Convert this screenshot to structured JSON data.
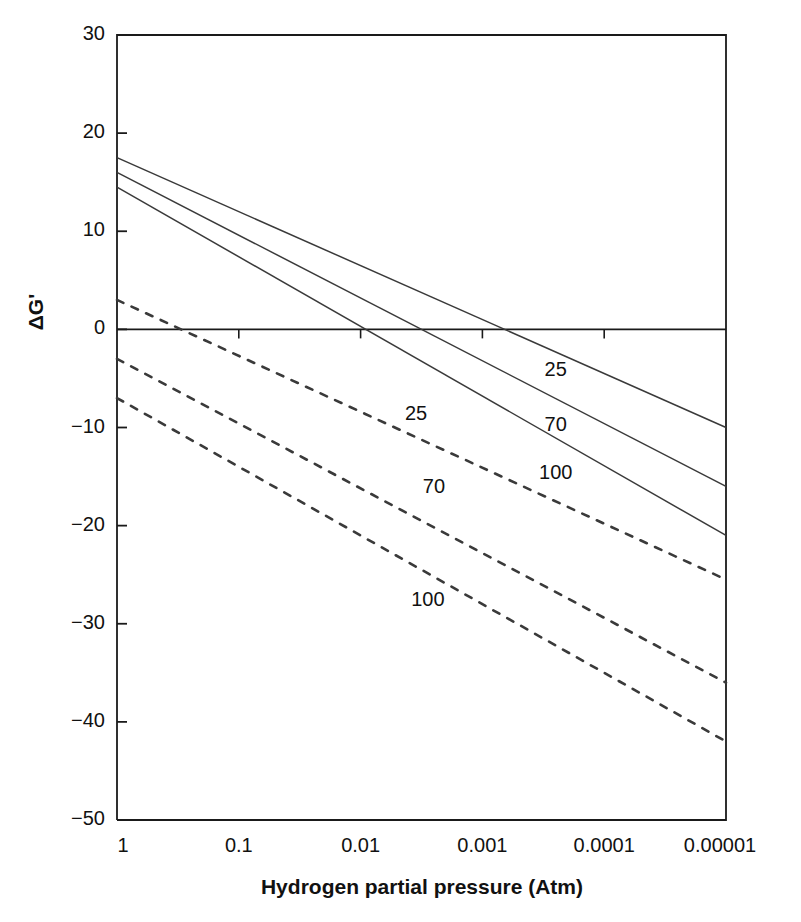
{
  "chart_data": {
    "type": "line",
    "title": "",
    "xlabel": "Hydrogen partial pressure (Atm)",
    "ylabel": "ΔG'",
    "x_scale": "log-reversed",
    "x_ticks": [
      "1",
      "0.1",
      "0.01",
      "0.001",
      "0.0001",
      "0.00001"
    ],
    "x_tick_values": [
      1,
      0.1,
      0.01,
      0.001,
      0.0001,
      1e-05
    ],
    "xlim": [
      1,
      1e-05
    ],
    "y_ticks": [
      "30",
      "20",
      "10",
      "0",
      "−10",
      "−20",
      "−30",
      "−40",
      "−50"
    ],
    "y_tick_values": [
      30,
      20,
      10,
      0,
      -10,
      -20,
      -30,
      -40,
      -50
    ],
    "ylim": [
      -50,
      30
    ],
    "grid": false,
    "legend": "inline-curve-labels",
    "zero_line": true,
    "series": [
      {
        "name": "25",
        "style": "solid",
        "label": "25",
        "label_x": 0.00025,
        "label_y": -4.0,
        "x": [
          1,
          1e-05
        ],
        "values": [
          17.5,
          -10.0
        ]
      },
      {
        "name": "70",
        "style": "solid",
        "label": "70",
        "label_x": 0.00025,
        "label_y": -9.6,
        "x": [
          1,
          1e-05
        ],
        "values": [
          16.0,
          -16.0
        ]
      },
      {
        "name": "100",
        "style": "solid",
        "label": "100",
        "label_x": 0.00025,
        "label_y": -14.5,
        "x": [
          1,
          1e-05
        ],
        "values": [
          14.5,
          -21.0
        ]
      },
      {
        "name": "25-dashed",
        "style": "dashed",
        "label": "25",
        "label_x": 0.0035,
        "label_y": -8.5,
        "x": [
          1,
          1e-05
        ],
        "values": [
          3.0,
          -25.5
        ]
      },
      {
        "name": "70-dashed",
        "style": "dashed",
        "label": "70",
        "label_x": 0.0025,
        "label_y": -16.0,
        "x": [
          1,
          1e-05
        ],
        "values": [
          -3.0,
          -36.0
        ]
      },
      {
        "name": "100-dashed",
        "style": "dashed",
        "label": "100",
        "label_x": 0.0028,
        "label_y": -27.5,
        "x": [
          1,
          1e-05
        ],
        "values": [
          -7.0,
          -42.0
        ]
      }
    ],
    "colors": {
      "line": "#3a3a3a",
      "axis": "#1a1a1a",
      "text": "#111111",
      "background": "#ffffff"
    }
  }
}
